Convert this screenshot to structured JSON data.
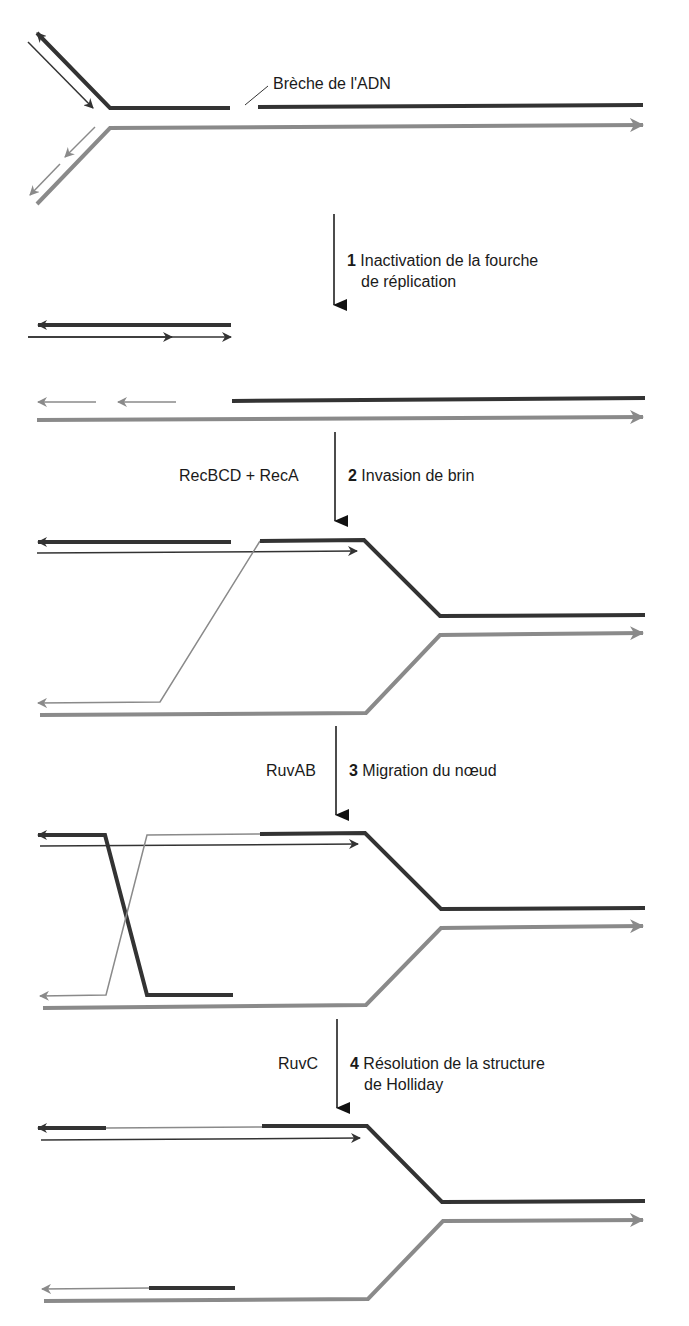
{
  "figure": {
    "colors": {
      "dark_strand": "#333333",
      "light_strand": "#8a8a8a",
      "arrow": "#111111",
      "background": "#ffffff"
    }
  },
  "annotations": {
    "break_label": "Brèche de l'ADN"
  },
  "steps": [
    {
      "number": "1",
      "label_line1": "Inactivation de la fourche",
      "label_line2": "de réplication",
      "enzyme": ""
    },
    {
      "number": "2",
      "label_line1": "Invasion de brin",
      "label_line2": "",
      "enzyme": "RecBCD + RecA"
    },
    {
      "number": "3",
      "label_line1": "Migration du nœud",
      "label_line2": "",
      "enzyme": "RuvAB"
    },
    {
      "number": "4",
      "label_line1": "Résolution de la structure",
      "label_line2": "de Holliday",
      "enzyme": "RuvC"
    }
  ],
  "panels": [
    {
      "name": "replication-fork-with-break"
    },
    {
      "name": "collapsed-fork"
    },
    {
      "name": "strand-invasion"
    },
    {
      "name": "branch-migration"
    },
    {
      "name": "holliday-resolution"
    }
  ]
}
